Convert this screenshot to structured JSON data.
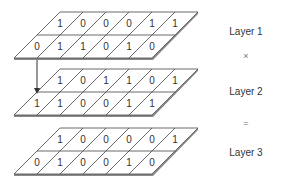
{
  "layers": [
    {
      "label": "Layer 1",
      "rows": [
        [
          1,
          0,
          0,
          0,
          1,
          1
        ],
        [
          0,
          1,
          1,
          0,
          1,
          0
        ]
      ]
    },
    {
      "label": "Layer 2",
      "rows": [
        [
          1,
          0,
          1,
          1,
          0,
          1
        ],
        [
          1,
          1,
          0,
          0,
          1,
          1
        ]
      ]
    },
    {
      "label": "Layer 3",
      "rows": [
        [
          1,
          0,
          0,
          0,
          0,
          1
        ],
        [
          0,
          1,
          0,
          0,
          1,
          0
        ]
      ]
    }
  ],
  "operators": [
    "×",
    "="
  ],
  "colors": {
    "grid_line": "#444444",
    "shadow": "#8a8a8a",
    "text": "#333333"
  }
}
